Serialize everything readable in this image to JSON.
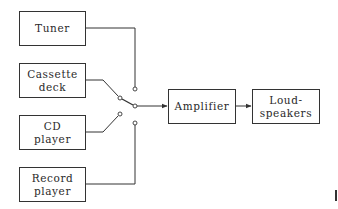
{
  "diagram": {
    "type": "block-diagram",
    "title": "",
    "sources": [
      {
        "id": "tuner",
        "lines": [
          "Tuner"
        ]
      },
      {
        "id": "cassette",
        "lines": [
          "Cassette",
          "deck"
        ]
      },
      {
        "id": "cd",
        "lines": [
          "CD",
          "player"
        ]
      },
      {
        "id": "record",
        "lines": [
          "Record",
          "player"
        ]
      }
    ],
    "amplifier": {
      "lines": [
        "Amplifier"
      ]
    },
    "speakers": {
      "lines": [
        "Loud-",
        "speakers"
      ]
    },
    "switch": {
      "type": "selector-switch",
      "positions": 4,
      "selected": "cassette"
    },
    "connections": [
      {
        "from": "tuner",
        "to": "switch"
      },
      {
        "from": "cassette",
        "to": "switch"
      },
      {
        "from": "cd",
        "to": "switch"
      },
      {
        "from": "record",
        "to": "switch"
      },
      {
        "from": "switch",
        "to": "amplifier",
        "arrow": true
      },
      {
        "from": "amplifier",
        "to": "speakers",
        "arrow": true
      }
    ],
    "colors": {
      "line": "#333333",
      "background": "#ffffff"
    }
  }
}
